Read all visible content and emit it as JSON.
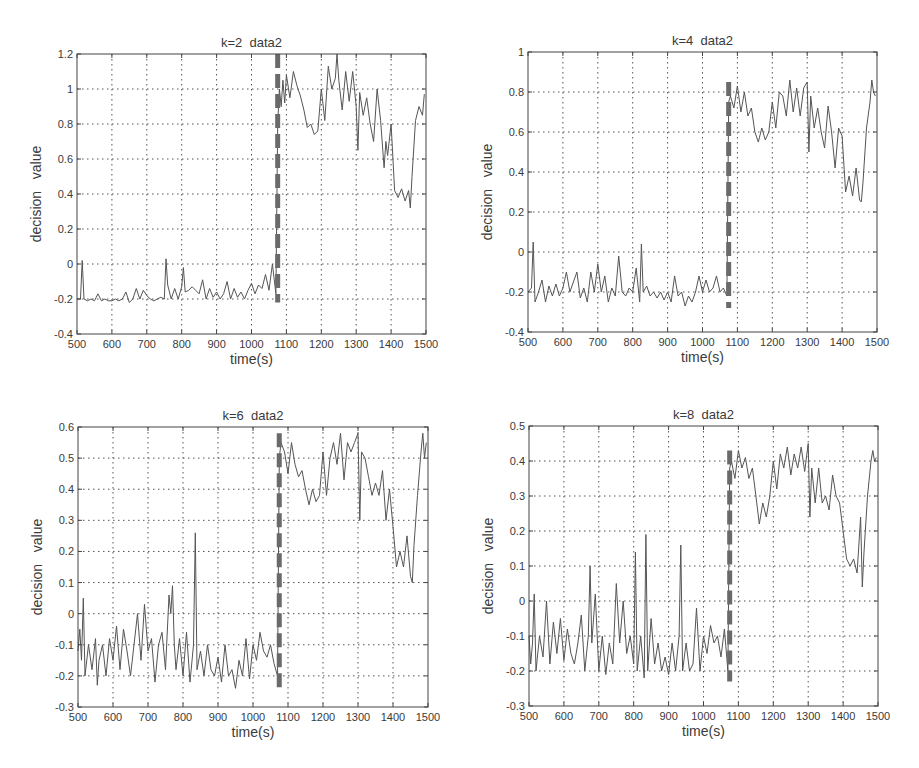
{
  "figure": {
    "layout": "2x2 grid",
    "line_color": "#555555",
    "change_line_color": "#6a6a6a"
  },
  "chart_data": [
    {
      "type": "line",
      "title": "k=2  data2",
      "xlabel": "time(s)",
      "ylabel": "decision   value",
      "xlim": [
        500,
        1500
      ],
      "ylim": [
        -0.4,
        1.2
      ],
      "xticks": [
        500,
        600,
        700,
        800,
        900,
        1000,
        1100,
        1200,
        1300,
        1400,
        1500
      ],
      "yticks": [
        -0.4,
        -0.2,
        0,
        0.2,
        0.4,
        0.6,
        0.8,
        1,
        1.2
      ],
      "ytick_labels": [
        "-0.4",
        "-0.2",
        "0",
        "0.2",
        "0.4",
        "0.6",
        "0.8",
        "1",
        "1.2"
      ],
      "grid": true,
      "change_point": {
        "x": 1075,
        "y_range": [
          -0.22,
          1.2
        ],
        "style": "thick dashed"
      },
      "series": [
        {
          "name": "decision value",
          "x": [
            500,
            510,
            515,
            520,
            530,
            540,
            550,
            560,
            570,
            580,
            590,
            600,
            610,
            620,
            630,
            640,
            650,
            660,
            670,
            680,
            690,
            700,
            710,
            720,
            730,
            740,
            750,
            755,
            760,
            770,
            780,
            790,
            800,
            805,
            810,
            820,
            830,
            840,
            850,
            860,
            870,
            880,
            890,
            900,
            910,
            920,
            930,
            940,
            950,
            960,
            970,
            980,
            990,
            1000,
            1010,
            1020,
            1030,
            1040,
            1050,
            1060,
            1070,
            1075,
            1080,
            1085,
            1090,
            1095,
            1100,
            1110,
            1120,
            1130,
            1140,
            1150,
            1160,
            1170,
            1180,
            1190,
            1200,
            1210,
            1220,
            1230,
            1240,
            1245,
            1250,
            1260,
            1270,
            1280,
            1290,
            1300,
            1305,
            1310,
            1320,
            1330,
            1340,
            1350,
            1360,
            1370,
            1380,
            1385,
            1390,
            1400,
            1410,
            1420,
            1430,
            1440,
            1450,
            1455,
            1460,
            1470,
            1480,
            1490,
            1495
          ],
          "y": [
            -0.2,
            -0.2,
            0.02,
            -0.2,
            -0.21,
            -0.2,
            -0.21,
            -0.17,
            -0.21,
            -0.2,
            -0.21,
            -0.21,
            -0.2,
            -0.21,
            -0.2,
            -0.16,
            -0.22,
            -0.2,
            -0.14,
            -0.2,
            -0.15,
            -0.18,
            -0.2,
            -0.21,
            -0.2,
            -0.19,
            -0.2,
            0.03,
            -0.12,
            -0.2,
            -0.14,
            -0.2,
            -0.13,
            -0.02,
            -0.16,
            -0.15,
            -0.13,
            -0.15,
            -0.17,
            -0.09,
            -0.2,
            -0.14,
            -0.19,
            -0.16,
            -0.2,
            -0.17,
            -0.1,
            -0.2,
            -0.14,
            -0.19,
            -0.16,
            -0.2,
            -0.15,
            -0.11,
            -0.17,
            -0.12,
            -0.14,
            -0.06,
            -0.15,
            0.0,
            -0.17,
            0.8,
            1.0,
            0.9,
            1.05,
            0.92,
            1.08,
            0.95,
            1.1,
            1.02,
            0.96,
            0.88,
            0.78,
            0.8,
            0.74,
            0.76,
            1.0,
            0.82,
            1.13,
            1.0,
            1.06,
            1.2,
            1.05,
            0.88,
            1.1,
            0.93,
            1.1,
            0.9,
            0.65,
            0.98,
            0.85,
            0.95,
            0.8,
            0.7,
            1.0,
            0.82,
            0.55,
            0.7,
            0.62,
            0.8,
            0.42,
            0.38,
            0.43,
            0.36,
            0.42,
            0.32,
            0.5,
            0.82,
            0.9,
            0.85,
            0.97
          ]
        }
      ]
    },
    {
      "type": "line",
      "title": "k=4  data2",
      "xlabel": "time(s)",
      "ylabel": "decision   value",
      "xlim": [
        500,
        1500
      ],
      "ylim": [
        -0.4,
        1
      ],
      "xticks": [
        500,
        600,
        700,
        800,
        900,
        1000,
        1100,
        1200,
        1300,
        1400,
        1500
      ],
      "yticks": [
        -0.4,
        -0.2,
        0,
        0.2,
        0.4,
        0.6,
        0.8,
        1
      ],
      "ytick_labels": [
        "-0.4",
        "-0.2",
        "0",
        "0.2",
        "0.4",
        "0.6",
        "0.8",
        "1"
      ],
      "grid": true,
      "change_point": {
        "x": 1075,
        "y_range": [
          -0.28,
          0.85
        ],
        "style": "thick dashed"
      },
      "series": [
        {
          "name": "decision value",
          "x": [
            500,
            510,
            515,
            520,
            530,
            540,
            550,
            560,
            570,
            580,
            590,
            600,
            610,
            620,
            630,
            640,
            650,
            660,
            670,
            680,
            690,
            700,
            710,
            720,
            730,
            740,
            750,
            760,
            770,
            780,
            790,
            800,
            810,
            820,
            825,
            830,
            840,
            850,
            860,
            870,
            880,
            890,
            900,
            910,
            920,
            930,
            940,
            950,
            960,
            970,
            980,
            990,
            1000,
            1010,
            1020,
            1030,
            1040,
            1050,
            1060,
            1070,
            1075,
            1080,
            1090,
            1100,
            1110,
            1120,
            1130,
            1140,
            1150,
            1160,
            1170,
            1180,
            1190,
            1200,
            1210,
            1220,
            1230,
            1240,
            1250,
            1260,
            1270,
            1280,
            1290,
            1300,
            1305,
            1310,
            1320,
            1330,
            1340,
            1350,
            1360,
            1370,
            1380,
            1390,
            1400,
            1410,
            1420,
            1430,
            1440,
            1450,
            1455,
            1460,
            1470,
            1480,
            1485,
            1490,
            1495
          ],
          "y": [
            -0.2,
            -0.18,
            0.05,
            -0.25,
            -0.2,
            -0.14,
            -0.25,
            -0.17,
            -0.22,
            -0.16,
            -0.22,
            -0.18,
            -0.1,
            -0.2,
            -0.15,
            -0.1,
            -0.23,
            -0.18,
            -0.25,
            -0.1,
            -0.2,
            -0.06,
            -0.2,
            -0.12,
            -0.25,
            -0.18,
            -0.22,
            -0.02,
            -0.2,
            -0.22,
            -0.18,
            -0.2,
            -0.08,
            -0.25,
            0.04,
            -0.2,
            -0.17,
            -0.22,
            -0.2,
            -0.23,
            -0.2,
            -0.24,
            -0.2,
            -0.25,
            -0.12,
            -0.22,
            -0.2,
            -0.27,
            -0.22,
            -0.25,
            -0.2,
            -0.12,
            -0.2,
            -0.14,
            -0.2,
            -0.18,
            -0.12,
            -0.2,
            -0.18,
            -0.22,
            0.75,
            0.78,
            0.72,
            0.83,
            0.7,
            0.8,
            0.68,
            0.72,
            0.6,
            0.55,
            0.62,
            0.56,
            0.6,
            0.75,
            0.62,
            0.8,
            0.78,
            0.68,
            0.86,
            0.7,
            0.82,
            0.68,
            0.82,
            0.85,
            0.5,
            0.78,
            0.62,
            0.72,
            0.6,
            0.52,
            0.73,
            0.6,
            0.42,
            0.62,
            0.58,
            0.3,
            0.38,
            0.28,
            0.42,
            0.26,
            0.25,
            0.35,
            0.62,
            0.75,
            0.86,
            0.8,
            0.78
          ]
        }
      ]
    },
    {
      "type": "line",
      "title": "k=6  data2",
      "xlabel": "time(s)",
      "ylabel": "decision   value",
      "xlim": [
        500,
        1500
      ],
      "ylim": [
        -0.3,
        0.6
      ],
      "xticks": [
        500,
        600,
        700,
        800,
        900,
        1000,
        1100,
        1200,
        1300,
        1400,
        1500
      ],
      "yticks": [
        -0.3,
        -0.2,
        -0.1,
        0,
        0.1,
        0.2,
        0.3,
        0.4,
        0.5,
        0.6
      ],
      "ytick_labels": [
        "-0.3",
        "-0.2",
        "-0.1",
        "0",
        "0.1",
        "0.2",
        "0.3",
        "0.4",
        "0.5",
        "0.6"
      ],
      "grid": true,
      "change_point": {
        "x": 1075,
        "y_range": [
          -0.25,
          0.58
        ],
        "style": "thick dashed"
      },
      "series": [
        {
          "name": "decision value",
          "x": [
            500,
            505,
            510,
            515,
            520,
            530,
            540,
            550,
            555,
            560,
            570,
            580,
            590,
            600,
            610,
            620,
            630,
            640,
            650,
            660,
            670,
            680,
            690,
            700,
            710,
            720,
            730,
            740,
            750,
            760,
            765,
            770,
            775,
            780,
            790,
            800,
            810,
            820,
            830,
            835,
            840,
            850,
            860,
            870,
            880,
            890,
            900,
            910,
            920,
            930,
            940,
            950,
            960,
            970,
            980,
            990,
            1000,
            1010,
            1020,
            1030,
            1040,
            1050,
            1060,
            1070,
            1075,
            1080,
            1090,
            1100,
            1110,
            1120,
            1130,
            1140,
            1150,
            1160,
            1170,
            1180,
            1190,
            1200,
            1210,
            1220,
            1230,
            1240,
            1250,
            1260,
            1270,
            1280,
            1290,
            1300,
            1305,
            1310,
            1320,
            1330,
            1340,
            1350,
            1360,
            1370,
            1380,
            1390,
            1400,
            1410,
            1420,
            1430,
            1440,
            1450,
            1455,
            1460,
            1470,
            1480,
            1485,
            1490,
            1495
          ],
          "y": [
            -0.12,
            -0.05,
            -0.15,
            0.05,
            -0.2,
            -0.1,
            -0.18,
            -0.08,
            -0.23,
            -0.15,
            -0.1,
            -0.2,
            -0.08,
            -0.15,
            -0.04,
            -0.18,
            -0.05,
            -0.12,
            -0.2,
            -0.1,
            0.0,
            -0.15,
            0.03,
            -0.12,
            -0.08,
            -0.22,
            -0.1,
            -0.06,
            -0.18,
            0.06,
            0.0,
            0.09,
            -0.1,
            -0.18,
            -0.08,
            -0.2,
            -0.06,
            -0.22,
            -0.1,
            0.26,
            -0.18,
            -0.12,
            -0.2,
            -0.1,
            -0.18,
            -0.2,
            -0.14,
            -0.22,
            -0.1,
            -0.2,
            -0.18,
            -0.24,
            -0.15,
            -0.2,
            -0.08,
            -0.21,
            -0.1,
            -0.15,
            -0.06,
            -0.12,
            -0.14,
            -0.1,
            -0.16,
            -0.2,
            0.5,
            0.55,
            0.52,
            0.45,
            0.55,
            0.48,
            0.44,
            0.46,
            0.4,
            0.35,
            0.4,
            0.36,
            0.38,
            0.52,
            0.38,
            0.5,
            0.55,
            0.48,
            0.58,
            0.43,
            0.55,
            0.52,
            0.55,
            0.58,
            0.3,
            0.52,
            0.5,
            0.44,
            0.38,
            0.42,
            0.38,
            0.46,
            0.3,
            0.4,
            0.28,
            0.15,
            0.2,
            0.15,
            0.25,
            0.12,
            0.1,
            0.22,
            0.38,
            0.52,
            0.58,
            0.5,
            0.55
          ]
        }
      ]
    },
    {
      "type": "line",
      "title": "k=8  data2",
      "xlabel": "time(s)",
      "ylabel": "decision   value",
      "xlim": [
        500,
        1500
      ],
      "ylim": [
        -0.3,
        0.5
      ],
      "xticks": [
        500,
        600,
        700,
        800,
        900,
        1000,
        1100,
        1200,
        1300,
        1400,
        1500
      ],
      "yticks": [
        -0.3,
        -0.2,
        -0.1,
        0,
        0.1,
        0.2,
        0.3,
        0.4,
        0.5
      ],
      "ytick_labels": [
        "-0.3",
        "-0.2",
        "-0.1",
        "0",
        "0.1",
        "0.2",
        "0.3",
        "0.4",
        "0.5"
      ],
      "grid": true,
      "change_point": {
        "x": 1075,
        "y_range": [
          -0.23,
          0.43
        ],
        "style": "thick dashed"
      },
      "series": [
        {
          "name": "decision value",
          "x": [
            500,
            505,
            510,
            515,
            520,
            530,
            540,
            550,
            560,
            570,
            580,
            590,
            600,
            610,
            620,
            630,
            640,
            650,
            660,
            670,
            675,
            680,
            690,
            700,
            710,
            720,
            730,
            740,
            750,
            760,
            770,
            780,
            790,
            800,
            805,
            810,
            820,
            830,
            835,
            840,
            850,
            860,
            870,
            880,
            890,
            900,
            910,
            920,
            930,
            935,
            940,
            950,
            960,
            970,
            980,
            990,
            1000,
            1010,
            1020,
            1030,
            1040,
            1050,
            1060,
            1070,
            1075,
            1080,
            1090,
            1100,
            1110,
            1120,
            1130,
            1140,
            1150,
            1160,
            1170,
            1180,
            1190,
            1200,
            1210,
            1220,
            1230,
            1240,
            1250,
            1260,
            1270,
            1280,
            1290,
            1300,
            1305,
            1310,
            1320,
            1330,
            1340,
            1350,
            1360,
            1370,
            1380,
            1390,
            1400,
            1410,
            1420,
            1430,
            1440,
            1450,
            1455,
            1460,
            1470,
            1480,
            1485,
            1490,
            1495
          ],
          "y": [
            -0.1,
            -0.18,
            -0.12,
            0.02,
            -0.2,
            -0.1,
            -0.16,
            0.0,
            -0.18,
            -0.06,
            -0.15,
            -0.05,
            -0.17,
            -0.08,
            -0.15,
            -0.18,
            -0.12,
            -0.04,
            -0.2,
            -0.1,
            0.1,
            -0.12,
            0.02,
            -0.2,
            -0.1,
            -0.21,
            -0.12,
            -0.18,
            0.05,
            -0.12,
            0.0,
            -0.15,
            -0.1,
            -0.18,
            0.14,
            -0.2,
            -0.1,
            -0.22,
            0.19,
            -0.2,
            -0.05,
            -0.18,
            -0.12,
            -0.2,
            -0.16,
            -0.21,
            -0.12,
            -0.2,
            -0.1,
            0.16,
            -0.2,
            -0.12,
            -0.2,
            -0.18,
            -0.02,
            -0.2,
            -0.1,
            -0.15,
            -0.07,
            -0.12,
            -0.1,
            -0.16,
            -0.08,
            -0.2,
            0.38,
            0.4,
            0.35,
            0.43,
            0.38,
            0.41,
            0.35,
            0.38,
            0.3,
            0.22,
            0.28,
            0.24,
            0.3,
            0.4,
            0.32,
            0.42,
            0.38,
            0.44,
            0.36,
            0.42,
            0.38,
            0.44,
            0.37,
            0.45,
            0.24,
            0.38,
            0.28,
            0.38,
            0.28,
            0.3,
            0.26,
            0.36,
            0.3,
            0.28,
            0.2,
            0.12,
            0.1,
            0.12,
            0.08,
            0.24,
            0.04,
            0.14,
            0.3,
            0.4,
            0.43,
            0.4,
            0.41
          ]
        }
      ]
    }
  ]
}
